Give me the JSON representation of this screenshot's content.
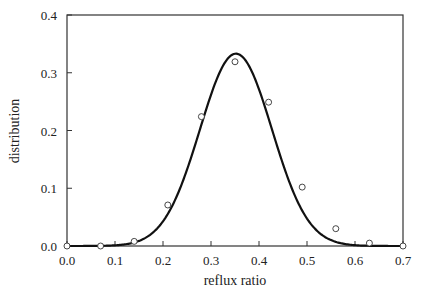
{
  "chart_data": {
    "type": "scatter",
    "title": "",
    "xlabel": "reflux ratio",
    "ylabel": "distribution",
    "xlim": [
      0.0,
      0.7
    ],
    "ylim": [
      0.0,
      0.4
    ],
    "xticks": [
      "0.0",
      "0.1",
      "0.2",
      "0.3",
      "0.4",
      "0.5",
      "0.6",
      "0.7"
    ],
    "yticks": [
      "0.0",
      "0.1",
      "0.2",
      "0.3",
      "0.4"
    ],
    "grid": false,
    "legend": null,
    "series": [
      {
        "name": "data points",
        "type": "scatter",
        "marker": "open-circle",
        "x": [
          0.0,
          0.07,
          0.14,
          0.21,
          0.28,
          0.35,
          0.42,
          0.49,
          0.56,
          0.63,
          0.7
        ],
        "y": [
          0.0,
          0.0,
          0.008,
          0.071,
          0.224,
          0.319,
          0.249,
          0.102,
          0.03,
          0.005,
          0.0
        ]
      },
      {
        "name": "fitted curve",
        "type": "line",
        "shape": "gaussian",
        "peak_x": 0.352,
        "peak_y": 0.333,
        "sigma": 0.075
      }
    ]
  }
}
